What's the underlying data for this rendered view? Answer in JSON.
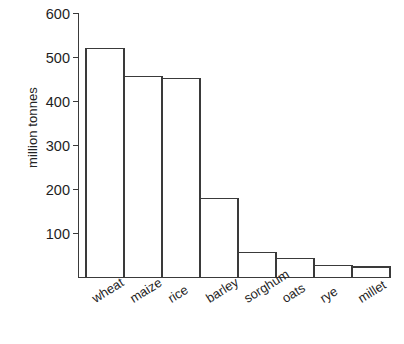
{
  "chart_data": {
    "type": "bar",
    "title": "",
    "xlabel": "",
    "ylabel": "million tonnes",
    "categories": [
      "wheat",
      "maize",
      "rice",
      "barley",
      "sorghum",
      "oats",
      "rye",
      "millet"
    ],
    "values": [
      520,
      457,
      453,
      180,
      57,
      44,
      28,
      24
    ],
    "ylim": [
      0,
      600
    ],
    "yticks": [
      100,
      200,
      300,
      400,
      500,
      600
    ],
    "ytick_labels": [
      "100",
      "200",
      "300",
      "400",
      "500",
      "600"
    ],
    "grid": false,
    "legend": null,
    "bar_style": {
      "fill": "#ffffff",
      "stroke": "#3a3a3a",
      "stroke_width": 1.2
    },
    "axis_color": "#3a3a3a",
    "background": "#ffffff"
  },
  "axis": {
    "ylabel": "million tonnes"
  }
}
